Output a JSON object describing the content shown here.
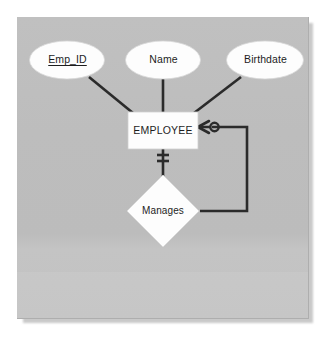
{
  "diagram": {
    "type": "entity-relationship-diagram",
    "notation": "crow's foot",
    "title": "",
    "background_color": "#bdbdbd",
    "shape_fill": "#ffffff",
    "line_color": "#2b2b2b",
    "text_color": "#1d1d1d",
    "entities": [
      {
        "id": "employee",
        "label": "EMPLOYEE",
        "shape": "rectangle",
        "x": 163,
        "y": 130,
        "width": 70,
        "height": 37
      }
    ],
    "attributes": [
      {
        "id": "emp_id",
        "label": "Emp_ID",
        "shape": "ellipse",
        "is_primary_key": true,
        "x": 67,
        "y": 60,
        "width": 75,
        "height": 38
      },
      {
        "id": "name",
        "label": "Name",
        "shape": "ellipse",
        "is_primary_key": false,
        "x": 163,
        "y": 60,
        "width": 75,
        "height": 38
      },
      {
        "id": "birthdate",
        "label": "Birthdate",
        "shape": "ellipse",
        "is_primary_key": false,
        "x": 265,
        "y": 60,
        "width": 77,
        "height": 38
      }
    ],
    "relationships": [
      {
        "id": "manages",
        "label": "Manages",
        "shape": "diamond",
        "recursive": true,
        "x": 163,
        "y": 211,
        "width": 70,
        "height": 72
      }
    ],
    "connectors": [
      {
        "id": "emp_id-to-employee",
        "from": "emp_id",
        "to": "employee",
        "style": "straight"
      },
      {
        "id": "name-to-employee",
        "from": "name",
        "to": "employee",
        "style": "straight"
      },
      {
        "id": "birthdate-to-employee",
        "from": "birthdate",
        "to": "employee",
        "style": "straight"
      },
      {
        "id": "employee-to-manages-mandatory",
        "from": "employee",
        "to": "manages",
        "style": "straight",
        "cardinality": "one and only one",
        "marker": "double-bar"
      },
      {
        "id": "manages-to-employee-optional-many",
        "from": "manages",
        "to": "employee",
        "style": "orthogonal",
        "cardinality": "zero or many",
        "marker": "crow-foot-with-circle"
      }
    ]
  }
}
